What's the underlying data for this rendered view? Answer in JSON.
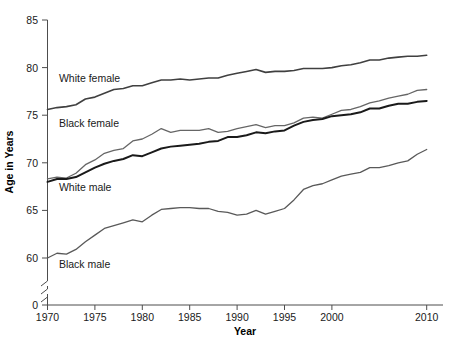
{
  "chart_data": {
    "type": "line",
    "title": "",
    "xlabel": "Year",
    "ylabel": "Age in Years",
    "xlim": [
      1970,
      2010
    ],
    "ylim": [
      0,
      85
    ],
    "y_axis_break": true,
    "y_break_note": "axis broken between 0 and ~58",
    "grid": false,
    "legend": "inline-labels",
    "xticks": [
      1970,
      1975,
      1980,
      1985,
      1990,
      1995,
      2000,
      2010
    ],
    "xtick_labels": [
      "1970",
      "1975",
      "1980",
      "1985",
      "1990",
      "1995",
      "2000",
      "2010"
    ],
    "yticks": [
      0,
      60,
      65,
      70,
      75,
      80,
      85
    ],
    "ytick_labels": [
      "0",
      "60",
      "65",
      "70",
      "75",
      "80",
      "85"
    ],
    "x": [
      1970,
      1971,
      1972,
      1973,
      1974,
      1975,
      1976,
      1977,
      1978,
      1979,
      1980,
      1981,
      1982,
      1983,
      1984,
      1985,
      1986,
      1987,
      1988,
      1989,
      1990,
      1991,
      1992,
      1993,
      1994,
      1995,
      1996,
      1997,
      1998,
      1999,
      2000,
      2001,
      2002,
      2003,
      2004,
      2005,
      2006,
      2007,
      2008,
      2009,
      2010
    ],
    "series": [
      {
        "name": "White female",
        "label": "White female",
        "color": "#404040",
        "line_width": 1.6,
        "values": [
          75.6,
          75.8,
          75.9,
          76.1,
          76.7,
          76.9,
          77.3,
          77.7,
          77.8,
          78.1,
          78.1,
          78.4,
          78.7,
          78.7,
          78.8,
          78.7,
          78.8,
          78.9,
          78.9,
          79.2,
          79.4,
          79.6,
          79.8,
          79.5,
          79.6,
          79.6,
          79.7,
          79.9,
          79.9,
          79.9,
          80.0,
          80.2,
          80.3,
          80.5,
          80.8,
          80.8,
          81.0,
          81.1,
          81.2,
          81.2,
          81.3
        ]
      },
      {
        "name": "Black female",
        "label": "Black female",
        "color": "#666666",
        "line_width": 1.3,
        "values": [
          68.3,
          68.5,
          68.4,
          68.9,
          69.8,
          70.3,
          71.0,
          71.3,
          71.5,
          72.3,
          72.5,
          73.0,
          73.6,
          73.2,
          73.4,
          73.4,
          73.4,
          73.6,
          73.2,
          73.3,
          73.6,
          73.8,
          74.0,
          73.7,
          73.9,
          73.9,
          74.2,
          74.7,
          74.8,
          74.7,
          75.1,
          75.5,
          75.6,
          75.9,
          76.3,
          76.5,
          76.8,
          77.0,
          77.2,
          77.6,
          77.7
        ]
      },
      {
        "name": "White male",
        "label": "White male",
        "color": "#1a1a1a",
        "line_width": 2.0,
        "values": [
          68.0,
          68.3,
          68.3,
          68.5,
          69.0,
          69.5,
          69.9,
          70.2,
          70.4,
          70.8,
          70.7,
          71.1,
          71.5,
          71.7,
          71.8,
          71.9,
          72.0,
          72.2,
          72.3,
          72.7,
          72.7,
          72.9,
          73.2,
          73.1,
          73.3,
          73.4,
          73.9,
          74.3,
          74.5,
          74.6,
          74.9,
          75.0,
          75.1,
          75.3,
          75.7,
          75.7,
          76.0,
          76.2,
          76.2,
          76.4,
          76.5
        ]
      },
      {
        "name": "Black male",
        "label": "Black male",
        "color": "#595959",
        "line_width": 1.3,
        "values": [
          60.0,
          60.5,
          60.4,
          60.9,
          61.7,
          62.4,
          63.1,
          63.4,
          63.7,
          64.0,
          63.8,
          64.5,
          65.1,
          65.2,
          65.3,
          65.3,
          65.2,
          65.2,
          64.9,
          64.8,
          64.5,
          64.6,
          65.0,
          64.6,
          64.9,
          65.2,
          66.1,
          67.2,
          67.6,
          67.8,
          68.2,
          68.6,
          68.8,
          69.0,
          69.5,
          69.5,
          69.7,
          70.0,
          70.2,
          70.9,
          71.4
        ]
      }
    ],
    "annotations": [
      {
        "text": "White female",
        "x": 1971.2,
        "y": 78.5
      },
      {
        "text": "Black female",
        "x": 1971.2,
        "y": 73.8
      },
      {
        "text": "White male",
        "x": 1971.2,
        "y": 67.0
      },
      {
        "text": "Black male",
        "x": 1971.2,
        "y": 58.9
      }
    ]
  },
  "axis": {
    "x_title": "Year",
    "y_title": "Age in Years"
  }
}
